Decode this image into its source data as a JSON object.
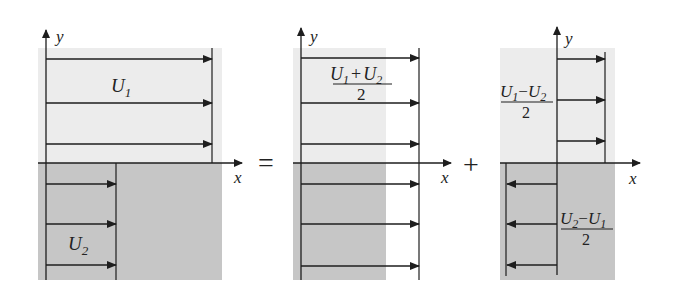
{
  "colors": {
    "upper_region": "#ececec",
    "lower_region": "#c6c6c6",
    "lines": "#1e1e1e"
  },
  "operators": {
    "equals": "=",
    "plus": "+"
  },
  "panels": [
    {
      "name": "original-profile",
      "axis_x": "x",
      "axis_y": "y",
      "upper_label": {
        "main": "U",
        "sub": "1"
      },
      "lower_label": {
        "main": "U",
        "sub": "2"
      }
    },
    {
      "name": "mean-profile",
      "axis_x": "x",
      "axis_y": "y",
      "label": {
        "num_a": "U",
        "sub_a": "1",
        "plus": "+",
        "num_b": "U",
        "sub_b": "2",
        "den": "2"
      }
    },
    {
      "name": "difference-profile",
      "axis_x": "x",
      "axis_y": "y",
      "upper_label": {
        "num_a": "U",
        "sub_a": "1",
        "minus": "−",
        "num_b": "U",
        "sub_b": "2",
        "den": "2"
      },
      "lower_label": {
        "num_a": "U",
        "sub_a": "2",
        "minus": "−",
        "num_b": "U",
        "sub_b": "1",
        "den": "2"
      }
    }
  ]
}
